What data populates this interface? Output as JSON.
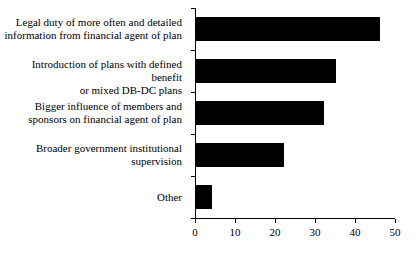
{
  "chart_data": {
    "type": "bar",
    "orientation": "horizontal",
    "title": "",
    "subtitle": "",
    "xlabel": "",
    "ylabel": "",
    "xlim": [
      0,
      50
    ],
    "xticks": [
      "0",
      "10",
      "20",
      "30",
      "40",
      "50"
    ],
    "grid": false,
    "legend": false,
    "bar_color": "#000000",
    "background_color": "#ffffff",
    "axis_color": "#000000",
    "categories": [
      "Legal duty of more often and detailed\ninformation from financial agent of plan",
      "Introduction of plans with defined benefit\nor mixed DB-DC plans",
      "Bigger influence of members and\nsponsors on financial agent of plan",
      "Broader government institutional\nsupervision",
      "Other"
    ],
    "values": [
      46,
      35,
      32,
      22,
      4
    ]
  }
}
